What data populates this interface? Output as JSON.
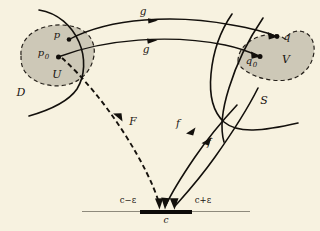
{
  "figure": {
    "kind": "mathematical-diagram",
    "background_color": "#f7f2e0",
    "ink_color": "#13100c",
    "blob_fill_color": "#cdc8b7",
    "axis_line_color": "#8e8a7c"
  },
  "regions": {
    "domain_blob": {
      "interior_label": "U",
      "exterior_label": "D",
      "points": [
        {
          "name": "p",
          "label": "p",
          "subscript": ""
        },
        {
          "name": "p-zero",
          "label": "p",
          "subscript": "0"
        }
      ]
    },
    "codomain_blob": {
      "interior_label": "V",
      "exterior_label": "S",
      "points": [
        {
          "name": "q",
          "label": "q",
          "subscript": ""
        },
        {
          "name": "q-zero",
          "label": "q",
          "subscript": "0"
        }
      ]
    }
  },
  "maps": {
    "g_upper": "g",
    "g_lower": "g",
    "f_upper": "f",
    "f_lower": "f",
    "F": "F"
  },
  "axis": {
    "center_label": "c",
    "left_label": "c−ε",
    "right_label": "c+ε"
  }
}
